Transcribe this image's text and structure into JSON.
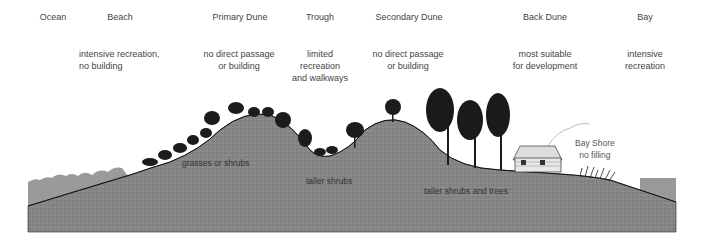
{
  "zones": [
    {
      "name": "Ocean",
      "x": 53,
      "note": []
    },
    {
      "name": "Beach",
      "x": 120,
      "note": [
        "intensive recreation,",
        "no building"
      ],
      "note_x": 79,
      "align": "left"
    },
    {
      "name": "Primary Dune",
      "x": 240,
      "note": [
        "no direct passage",
        "or building"
      ],
      "note_x": 239
    },
    {
      "name": "Trough",
      "x": 320,
      "note": [
        "limited",
        "recreation",
        "and walkways"
      ],
      "note_x": 320
    },
    {
      "name": "Secondary Dune",
      "x": 409,
      "note": [
        "no direct passage",
        "or building"
      ],
      "note_x": 408
    },
    {
      "name": "Back Dune",
      "x": 545,
      "note": [
        "most suitable",
        "for development"
      ],
      "note_x": 545
    },
    {
      "name": "Bay",
      "x": 645,
      "note": [
        "intensive",
        "recreation"
      ],
      "note_x": 645
    }
  ],
  "ground_labels": {
    "primary_dune": "grasses or shrubs",
    "trough": "taller shrubs",
    "secondary_dune": "taller shrubs and trees"
  },
  "bay_shore": {
    "title": "Bay Shore",
    "note": "no filling"
  },
  "colors": {
    "ground": "#8a8a8a",
    "ground_dark": "#6f6f6f",
    "water": "#9a9a9a",
    "vegetation": "#1a1a1a",
    "text": "#444444"
  }
}
